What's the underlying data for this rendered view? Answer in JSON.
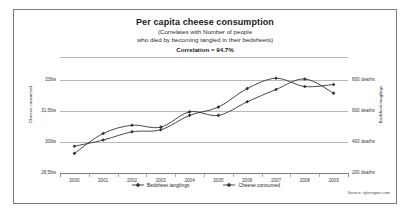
{
  "chart_data": {
    "type": "line",
    "title": "Per capita cheese consumption",
    "subtitle_line_1": "(Correlates with Number of people",
    "subtitle_line_2": "who died by becoming tangled in their bedsheets)",
    "correlation_text": "Correlation = 94.7%",
    "x": [
      2000,
      2001,
      2002,
      2003,
      2004,
      2005,
      2006,
      2007,
      2008,
      2009
    ],
    "xlabel": "",
    "xticklabels": [
      "2000",
      "2001",
      "2002",
      "2003",
      "2004",
      "2005",
      "2006",
      "2007",
      "2008",
      "2009"
    ],
    "grid": true,
    "legend_position": "bottom",
    "left_axis": {
      "ylabel": "Cheese consumed",
      "ticklabels": [
        "33lbs",
        "31.5lbs",
        "30lbs",
        "28.5lbs"
      ],
      "tickvalues": [
        33,
        31.5,
        30,
        28.5
      ],
      "ylim": [
        28.5,
        33.6
      ]
    },
    "right_axis": {
      "ylabel": "Bedsheet tanglings",
      "ticklabels": [
        "800 deaths",
        "600 deaths",
        "400 deaths",
        "200 deaths"
      ],
      "tickvalues": [
        800,
        600,
        400,
        200
      ],
      "ylim": [
        200,
        880
      ]
    },
    "series": [
      {
        "name": "Bedsheet tanglings",
        "axis": "right",
        "color": "#333333",
        "marker": "diamond",
        "values": [
          327,
          456,
          509,
          497,
          596,
          573,
          661,
          741,
          809,
          717
        ]
      },
      {
        "name": "Cheese consumed",
        "axis": "left",
        "color": "#333333",
        "marker": "diamond",
        "values": [
          29.8,
          30.1,
          30.5,
          30.6,
          31.3,
          31.7,
          32.6,
          33.1,
          32.7,
          32.8
        ]
      }
    ],
    "source": "Source: tylervigen.com"
  }
}
